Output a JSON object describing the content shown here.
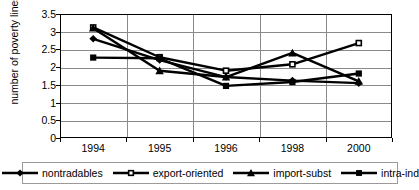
{
  "chart_data": {
    "type": "line",
    "title": "",
    "xlabel": "",
    "ylabel": "number of poverty lines",
    "categories": [
      "1994",
      "1995",
      "1996",
      "1998",
      "2000"
    ],
    "x": [
      1994,
      1995,
      1996,
      1998,
      2000
    ],
    "ylim": [
      0,
      3.5
    ],
    "yticks": [
      "0",
      "0.5",
      "1",
      "1.5",
      "2",
      "2.5",
      "3",
      "3.5"
    ],
    "ytick_values": [
      0,
      0.5,
      1,
      1.5,
      2,
      2.5,
      3,
      3.5
    ],
    "grid": true,
    "legend_position": "bottom",
    "series": [
      {
        "name": "nontradables",
        "marker": "diamond",
        "color": "#000000",
        "values": [
          2.8,
          2.2,
          1.72,
          1.62,
          1.55
        ]
      },
      {
        "name": "export-oriented",
        "marker": "square-open",
        "color": "#000000",
        "values": [
          3.12,
          2.28,
          1.9,
          2.08,
          2.68
        ]
      },
      {
        "name": "import-subst",
        "marker": "triangle",
        "color": "#000000",
        "values": [
          3.1,
          1.9,
          1.72,
          2.4,
          1.6
        ]
      },
      {
        "name": "intra-ind",
        "marker": "square-filled",
        "color": "#000000",
        "values": [
          2.27,
          2.25,
          1.47,
          1.58,
          1.82
        ]
      }
    ]
  },
  "legend": {
    "items": [
      {
        "label": "nontradables",
        "marker": "diamond"
      },
      {
        "label": "export-oriented",
        "marker": "square-open"
      },
      {
        "label": "import-subst",
        "marker": "triangle"
      },
      {
        "label": "intra-ind",
        "marker": "square-filled"
      }
    ]
  },
  "colors": {
    "line": "#000000",
    "grid": "#8a8a8a",
    "frame": "#000000",
    "background": "#ffffff"
  }
}
